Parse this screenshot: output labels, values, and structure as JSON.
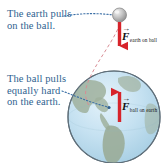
{
  "figure": {
    "background_color": "#ffffff"
  },
  "annotations": [
    {
      "id": "earth-pulls",
      "text": "The earth pulls\non the ball.",
      "color": "#2f5f8f",
      "leader": "dotted-blue"
    },
    {
      "id": "ball-pulls",
      "text": "The ball pulls\nequally hard\non the earth.",
      "color": "#2f5f8f",
      "leader": "dotted-blue"
    }
  ],
  "force_labels": [
    {
      "id": "force-earth-on-ball",
      "symbol": "F",
      "vector_arrow": "→",
      "subscript": "earth on ball",
      "arrow_direction": "down",
      "arrow_color": "#d7232a"
    },
    {
      "id": "force-ball-on-earth",
      "symbol": "F",
      "vector_arrow": "→",
      "subscript": "ball on earth",
      "arrow_direction": "up",
      "arrow_color": "#d7232a"
    }
  ],
  "objects": {
    "ball": {
      "name": "ball",
      "fill_color": "#b8b8b8",
      "highlight_color": "#e8e8e8"
    },
    "earth": {
      "name": "earth",
      "ocean_color": "#bcdcee",
      "land_color": "#9aac98",
      "outline_color": "#5f6f7a"
    }
  },
  "guides": {
    "dashed_curve_color": "#d88c94",
    "dotted_leader_color": "#3a6ea5"
  }
}
